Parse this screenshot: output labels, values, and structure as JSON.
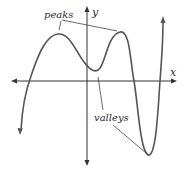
{
  "diagram": {
    "type": "function-graph",
    "axes": {
      "x_label": "x",
      "y_label": "y"
    },
    "annotations": {
      "peaks_label": "peaks",
      "valleys_label": "valleys"
    },
    "colors": {
      "curve": "#555555",
      "axes": "#333333",
      "leader_lines": "#444444",
      "text": "#2a2a2a",
      "background": "#ffffff"
    }
  }
}
